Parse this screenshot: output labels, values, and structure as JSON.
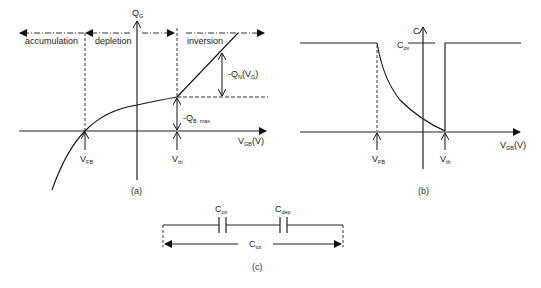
{
  "figure": {
    "panel_a": {
      "caption": "(a)",
      "y_axis": {
        "main": "Q",
        "sub": "G"
      },
      "x_axis": {
        "main": "V",
        "sub": "GB",
        "suffix": "(V)"
      },
      "regions": [
        "accumulation",
        "depletion",
        "inversion"
      ],
      "markers": [
        {
          "main": "V",
          "sub": "FB"
        },
        {
          "main": "V",
          "sub": "th"
        }
      ],
      "annotations": [
        {
          "prefix": "-Q",
          "sub": "N",
          "suffix": "(V",
          "sub2": "G",
          "end": ")"
        },
        {
          "prefix": "-Q",
          "sub": "B, max"
        }
      ]
    },
    "panel_b": {
      "caption": "(b)",
      "y_axis": {
        "main": "C"
      },
      "level_label": {
        "main": "C",
        "sub": "ox"
      },
      "x_axis": {
        "main": "V",
        "sub": "GB",
        "suffix": "(V)"
      },
      "markers": [
        {
          "main": "V",
          "sub": "FB"
        },
        {
          "main": "V",
          "sub": "th"
        }
      ]
    },
    "panel_c": {
      "caption": "(c)",
      "capacitors": [
        {
          "main": "C",
          "sub": "ox"
        },
        {
          "main": "C",
          "sub": "dep"
        }
      ],
      "total": {
        "main": "C",
        "sub": "tot"
      }
    }
  }
}
